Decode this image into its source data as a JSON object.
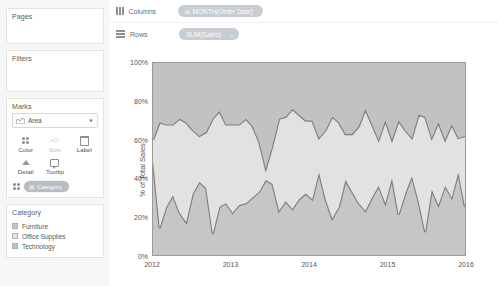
{
  "sidebar": {
    "pages": {
      "title": "Pages"
    },
    "filters": {
      "title": "Filters"
    },
    "marks": {
      "title": "Marks",
      "mark_type": "Area",
      "mark_type_icon": "area-chart-icon",
      "buttons": [
        {
          "label": "Color",
          "icon": "color-dots-icon",
          "enabled": true
        },
        {
          "label": "Size",
          "icon": "size-icon",
          "enabled": false
        },
        {
          "label": "Label",
          "icon": "label-box-icon",
          "enabled": true
        },
        {
          "label": "Detail",
          "icon": "detail-icon",
          "enabled": true
        },
        {
          "label": "Tooltip",
          "icon": "tooltip-icon",
          "enabled": true
        }
      ],
      "color_shelf_pill": "Category",
      "color_shelf_pill_icon": "dimension-icon"
    },
    "legend": {
      "title": "Category",
      "items": [
        {
          "label": "Furniture",
          "color": "#c6c6c6"
        },
        {
          "label": "Office Supplies",
          "color": "#e2e2e2"
        },
        {
          "label": "Technology",
          "color": "#c2c2c2"
        }
      ]
    }
  },
  "shelves": {
    "columns": {
      "label": "Columns",
      "pill": "MONTH(Order Date)",
      "pill_icon": "calendar-icon"
    },
    "rows": {
      "label": "Rows",
      "pill": "SUM(Sales)",
      "pill_suffix": "▵"
    }
  },
  "chart_data": {
    "type": "area",
    "title": "",
    "subtitle": "",
    "xlabel": "",
    "ylabel": "% of Total Sales",
    "stacked": "100%",
    "grid": false,
    "legend_position": "left-sidebar",
    "ylim": [
      0,
      100
    ],
    "yticks": [
      "0%",
      "20%",
      "40%",
      "60%",
      "80%",
      "100%"
    ],
    "ytick_values": [
      0,
      20,
      40,
      60,
      80,
      100
    ],
    "xticks": [
      "2012",
      "2013",
      "2014",
      "2015",
      "2016"
    ],
    "xtick_values": [
      0,
      12,
      24,
      36,
      48
    ],
    "x": [
      0,
      1,
      2,
      3,
      4,
      5,
      6,
      7,
      8,
      9,
      10,
      11,
      12,
      13,
      14,
      15,
      16,
      17,
      18,
      19,
      20,
      21,
      22,
      23,
      24,
      25,
      26,
      27,
      28,
      29,
      30,
      31,
      32,
      33,
      34,
      35,
      36,
      37,
      38,
      39,
      40,
      41,
      42,
      43,
      44,
      45,
      46,
      47
    ],
    "series": [
      {
        "name": "Furniture",
        "color": "#c6c6c6",
        "values": [
          49,
          14,
          25,
          31,
          22,
          17,
          32,
          38,
          35,
          11,
          25,
          27,
          22,
          26,
          27,
          30,
          33,
          39,
          37,
          23,
          28,
          24,
          29,
          32,
          29,
          43,
          29,
          19,
          25,
          39,
          33,
          27,
          23,
          30,
          36,
          27,
          40,
          21,
          32,
          41,
          28,
          12,
          34,
          26,
          36,
          30,
          43,
          25
        ]
      },
      {
        "name": "Office Supplies",
        "color": "#e2e2e2",
        "values": [
          11,
          55,
          43,
          37,
          49,
          52,
          33,
          24,
          29,
          60,
          50,
          41,
          46,
          42,
          44,
          37,
          26,
          6,
          20,
          48,
          44,
          52,
          44,
          38,
          41,
          18,
          36,
          53,
          44,
          24,
          30,
          40,
          53,
          38,
          24,
          43,
          20,
          49,
          33,
          20,
          45,
          60,
          27,
          43,
          24,
          38,
          18,
          37
        ]
      },
      {
        "name": "Technology",
        "color": "#c2c2c2",
        "values": [
          40,
          31,
          32,
          32,
          29,
          31,
          35,
          38,
          36,
          29,
          25,
          32,
          32,
          32,
          29,
          33,
          41,
          55,
          43,
          29,
          28,
          24,
          27,
          30,
          30,
          39,
          35,
          28,
          31,
          37,
          37,
          33,
          24,
          32,
          40,
          30,
          40,
          30,
          35,
          39,
          27,
          28,
          39,
          31,
          40,
          32,
          39,
          38
        ]
      }
    ]
  }
}
